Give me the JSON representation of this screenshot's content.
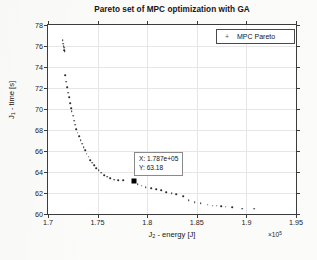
{
  "chart_data": {
    "type": "scatter",
    "title": "Pareto set of MPC optimization with GA",
    "xlabel": "J",
    "xlabel_sub": "2",
    "xlabel_rest": " - energy [J]",
    "ylabel": "J",
    "ylabel_sub": "1",
    "ylabel_rest": " - time [s]",
    "x_exponent_label": "×10",
    "x_exponent_power": "5",
    "xlim": [
      1.7,
      1.95
    ],
    "ylim": [
      60,
      78
    ],
    "xticks": [
      1.7,
      1.75,
      1.8,
      1.85,
      1.9,
      1.95
    ],
    "xticklabels": [
      "1.7",
      "1.75",
      "1.8",
      "1.85",
      "1.9",
      "1.95"
    ],
    "yticks": [
      60,
      62,
      64,
      66,
      68,
      70,
      72,
      74,
      76,
      78
    ],
    "yticklabels": [
      "60",
      "62",
      "64",
      "66",
      "68",
      "70",
      "72",
      "74",
      "76",
      "78"
    ],
    "grid": true,
    "legend_position": "top-right",
    "series": [
      {
        "name": "MPC Pareto",
        "marker": "dot",
        "color": "#2b2b2b",
        "points": [
          [
            1.7148,
            76.55
          ],
          [
            1.7155,
            76.2
          ],
          [
            1.7158,
            76.0
          ],
          [
            1.7162,
            75.82
          ],
          [
            1.7165,
            75.62
          ],
          [
            1.7168,
            75.5
          ],
          [
            1.7175,
            73.2
          ],
          [
            1.7185,
            72.6
          ],
          [
            1.7196,
            72.05
          ],
          [
            1.7206,
            71.55
          ],
          [
            1.7212,
            71.1
          ],
          [
            1.7222,
            70.55
          ],
          [
            1.7232,
            70.1
          ],
          [
            1.724,
            69.8
          ],
          [
            1.7252,
            69.35
          ],
          [
            1.7262,
            68.9
          ],
          [
            1.7272,
            68.5
          ],
          [
            1.7285,
            68.1
          ],
          [
            1.7298,
            67.75
          ],
          [
            1.7312,
            67.4
          ],
          [
            1.7328,
            67.05
          ],
          [
            1.7342,
            66.7
          ],
          [
            1.7358,
            66.35
          ],
          [
            1.7375,
            66.05
          ],
          [
            1.7392,
            65.75
          ],
          [
            1.741,
            65.45
          ],
          [
            1.7428,
            65.15
          ],
          [
            1.7446,
            64.88
          ],
          [
            1.7466,
            64.62
          ],
          [
            1.7488,
            64.38
          ],
          [
            1.7512,
            64.15
          ],
          [
            1.7538,
            63.92
          ],
          [
            1.7565,
            63.72
          ],
          [
            1.7596,
            63.55
          ],
          [
            1.763,
            63.4
          ],
          [
            1.7668,
            63.28
          ],
          [
            1.771,
            63.22
          ],
          [
            1.776,
            63.2
          ],
          [
            1.787,
            63.18
          ],
          [
            1.7905,
            62.85
          ],
          [
            1.7945,
            62.7
          ],
          [
            1.7985,
            62.58
          ],
          [
            1.804,
            62.45
          ],
          [
            1.809,
            62.35
          ],
          [
            1.814,
            62.28
          ],
          [
            1.819,
            62.1
          ],
          [
            1.8245,
            61.98
          ],
          [
            1.829,
            61.88
          ],
          [
            1.836,
            61.72
          ],
          [
            1.842,
            61.3
          ],
          [
            1.848,
            61.15
          ],
          [
            1.854,
            61.05
          ],
          [
            1.861,
            60.88
          ],
          [
            1.866,
            60.8
          ],
          [
            1.87,
            60.78
          ],
          [
            1.8745,
            60.72
          ],
          [
            1.879,
            60.7
          ],
          [
            1.8855,
            60.62
          ],
          [
            1.896,
            60.52
          ],
          [
            1.908,
            60.5
          ]
        ]
      }
    ],
    "highlight_point": {
      "x": 1.787,
      "y": 63.18,
      "marker": "filled-square",
      "color": "#000000"
    },
    "annotation": {
      "x_text": "X: 1.787e+05",
      "y_text": "Y: 63.18"
    }
  },
  "legend": {
    "marker_glyph": "+",
    "entries": [
      {
        "label": "MPC Pareto"
      }
    ]
  }
}
